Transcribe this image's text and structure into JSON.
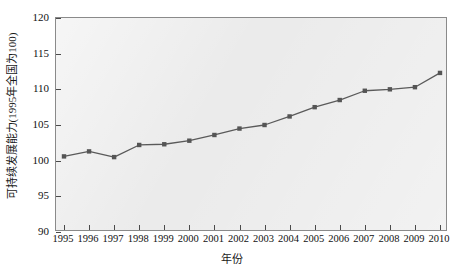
{
  "chart_data": {
    "type": "line",
    "title": "",
    "xlabel": "年份",
    "ylabel": "可持续发展能力(1995年全国为100)",
    "x": [
      1995,
      1996,
      1997,
      1998,
      1999,
      2000,
      2001,
      2002,
      2003,
      2004,
      2005,
      2006,
      2007,
      2008,
      2009,
      2010
    ],
    "categories": [
      "1995",
      "1996",
      "1997",
      "1998",
      "1999",
      "2000",
      "2001",
      "2002",
      "2003",
      "2004",
      "2005",
      "2006",
      "2007",
      "2008",
      "2009",
      "2010"
    ],
    "values": [
      100.6,
      101.3,
      100.5,
      102.2,
      102.3,
      102.8,
      103.6,
      104.5,
      105.0,
      106.2,
      107.5,
      108.5,
      109.8,
      110.0,
      110.3,
      112.3
    ],
    "series": [
      {
        "name": "可持续发展能力",
        "values": [
          100.6,
          101.3,
          100.5,
          102.2,
          102.3,
          102.8,
          103.6,
          104.5,
          105.0,
          106.2,
          107.5,
          108.5,
          109.8,
          110.0,
          110.3,
          112.3
        ]
      }
    ],
    "ylim": [
      90,
      120
    ],
    "xlim": [
      1995,
      2010
    ],
    "yticks": [
      90,
      95,
      100,
      105,
      110,
      115,
      120
    ],
    "ytick_labels": [
      "90",
      "95",
      "100",
      "105",
      "110",
      "115",
      "120"
    ],
    "grid": false,
    "legend": null,
    "legend_position": "none",
    "colors": {
      "line": "#5a5a5a",
      "marker": "#555555",
      "plot_background": "#ebebeb",
      "figure_background": "#ffffff",
      "axis": "#8a8a8a",
      "text": "#111111"
    },
    "marker": "square",
    "annotations": []
  }
}
